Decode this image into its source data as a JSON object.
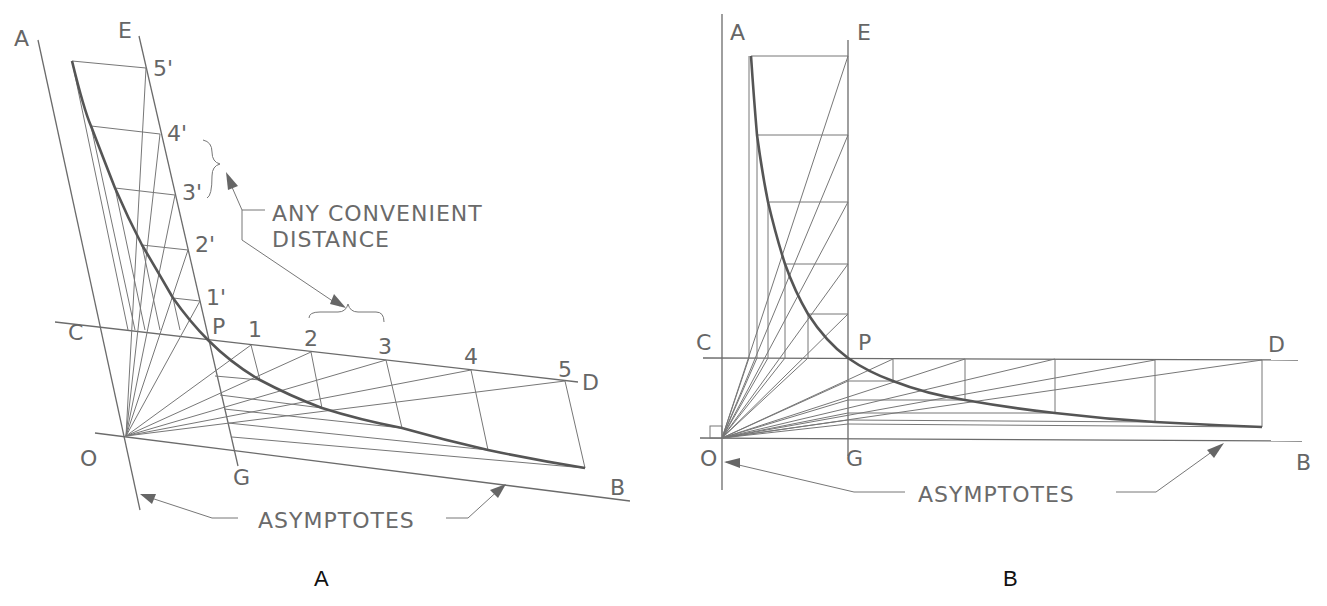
{
  "figure": {
    "panels": [
      {
        "id": "A",
        "caption": "A",
        "title": "Hyperbola construction with oblique asymptotes",
        "point_labels": {
          "A": "A",
          "E": "E",
          "C": "C",
          "P": "P",
          "D": "D",
          "O": "O",
          "G": "G",
          "B": "B"
        },
        "division_labels_cd": [
          "1",
          "2",
          "3",
          "4",
          "5"
        ],
        "division_labels_eg": [
          "1'",
          "2'",
          "3'",
          "4'",
          "5'"
        ],
        "annotations": {
          "convenient_distance_line1": "ANY CONVENIENT",
          "convenient_distance_line2": "DISTANCE",
          "asymptotes": "ASYMPTOTES"
        }
      },
      {
        "id": "B",
        "caption": "B",
        "title": "Hyperbola construction with perpendicular asymptotes",
        "point_labels": {
          "A": "A",
          "E": "E",
          "C": "C",
          "P": "P",
          "D": "D",
          "O": "O",
          "G": "G",
          "B": "B"
        },
        "annotations": {
          "asymptotes": "ASYMPTOTES"
        }
      }
    ]
  }
}
